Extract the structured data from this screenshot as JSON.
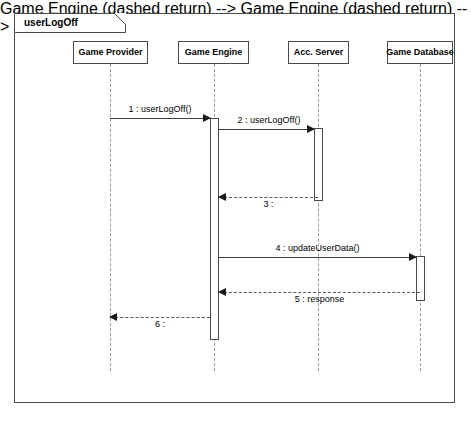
{
  "diagram": {
    "kind": "uml-sequence-diagram",
    "frame_label": "userLogOff",
    "participants": [
      {
        "id": "game-provider",
        "label": "Game Provider",
        "x": 110,
        "box_left": 73,
        "box_width": 75
      },
      {
        "id": "game-engine",
        "label": "Game Engine",
        "x": 214,
        "box_left": 178,
        "box_width": 71
      },
      {
        "id": "acc-server",
        "label": "Acc. Server",
        "x": 318,
        "box_left": 288,
        "box_width": 61
      },
      {
        "id": "game-database",
        "label": "Game Database",
        "x": 420,
        "box_left": 387,
        "box_width": 66
      }
    ],
    "activations": [
      {
        "id": "act-game-engine",
        "participant": "game-engine",
        "left": 210,
        "top": 118,
        "height": 222
      },
      {
        "id": "act-acc-server",
        "participant": "acc-server",
        "left": 314,
        "top": 128,
        "height": 73
      },
      {
        "id": "act-game-database",
        "participant": "game-database",
        "left": 416,
        "top": 256,
        "height": 45
      }
    ],
    "messages": [
      {
        "seq": "1",
        "label": "1 : userLogOff()",
        "from": "game-provider",
        "to": "game-engine",
        "style": "solid",
        "direction": "right",
        "y": 118,
        "left": 110,
        "width": 100,
        "label_top": 104
      },
      {
        "seq": "2",
        "label": "2 : userLogOff()",
        "from": "game-engine",
        "to": "acc-server",
        "style": "solid",
        "direction": "right",
        "y": 129,
        "left": 219,
        "width": 95,
        "label_top": 115
      },
      {
        "seq": "3",
        "label": "3 :",
        "from": "acc-server",
        "to": "game-engine",
        "style": "dashed",
        "direction": "left",
        "y": 197,
        "left": 219,
        "width": 99,
        "label_top": 199
      },
      {
        "seq": "4",
        "label": "4 : updateUserData()",
        "from": "game-engine",
        "to": "game-database",
        "style": "solid",
        "direction": "right",
        "y": 257,
        "left": 219,
        "width": 197,
        "label_top": 243
      },
      {
        "seq": "5",
        "label": "5 : response",
        "from": "game-database",
        "to": "game-engine",
        "style": "dashed",
        "direction": "left",
        "y": 292,
        "left": 219,
        "width": 201,
        "label_top": 294
      },
      {
        "seq": "6",
        "label": "6 :",
        "from": "game-engine",
        "to": "game-provider",
        "style": "dashed",
        "direction": "left",
        "y": 317,
        "left": 110,
        "width": 100,
        "label_top": 319
      }
    ],
    "lifeline_top": 64,
    "lifeline_bottom": 371,
    "colors": {
      "frame_border": "#4a4a4a",
      "box_border": "#4a4a4a",
      "lifeline": "#9a9a9a",
      "message_solid": "#3c3c3c",
      "message_dashed": "#5a5a5a",
      "text": "#000000",
      "background": "#ffffff"
    }
  }
}
